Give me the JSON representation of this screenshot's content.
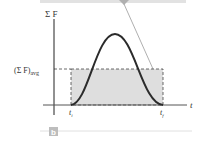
{
  "figure": {
    "panel_label": "b",
    "y_axis_label": "Σ F",
    "x_axis_label": "t",
    "avg_label_main": "(Σ F)",
    "avg_label_sub": "avg",
    "t_start_label": "t",
    "t_start_sub": "i",
    "t_end_label": "t",
    "t_end_sub": "f",
    "colors": {
      "curve": "#2b2b2b",
      "fill": "#d9d9d9",
      "axis": "#222222",
      "leader_line": "#9a9a9a",
      "top_bar": "#dcdcdc"
    }
  }
}
